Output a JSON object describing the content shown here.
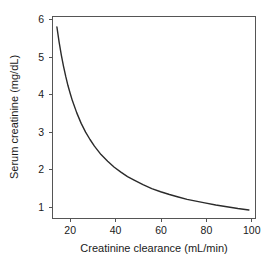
{
  "chart_data": {
    "type": "line",
    "title": "",
    "xlabel": "Creatinine clearance (mL/min)",
    "ylabel": "Serum creatinine (mg/dL)",
    "xlim": [
      11,
      103
    ],
    "ylim": [
      0.55,
      6.3
    ],
    "xticks": [
      20,
      40,
      60,
      80,
      100
    ],
    "xtick_labels": [
      "20",
      "40",
      "60",
      "80",
      "100"
    ],
    "yticks": [
      1,
      2,
      3,
      4,
      5,
      6
    ],
    "ytick_labels": [
      "1",
      "2",
      "3",
      "4",
      "5",
      "6"
    ],
    "grid": false,
    "legend": null,
    "legend_position": "none",
    "series": [
      {
        "name": "Serum creatinine vs creatinine clearance",
        "color": "#2b2b2b",
        "relationship": "serum creatinine = 78 / creatinine clearance",
        "x": [
          13,
          14,
          15,
          16,
          17,
          18,
          19,
          20,
          22,
          24,
          26,
          28,
          30,
          33,
          36,
          39,
          42,
          45,
          48,
          52,
          56,
          60,
          64,
          68,
          72,
          76,
          80,
          85,
          90,
          95,
          100
        ],
        "values": [
          6.0,
          5.57,
          5.2,
          4.88,
          4.59,
          4.33,
          4.11,
          3.9,
          3.55,
          3.25,
          3.0,
          2.79,
          2.6,
          2.36,
          2.17,
          2.0,
          1.86,
          1.73,
          1.63,
          1.5,
          1.39,
          1.3,
          1.22,
          1.15,
          1.08,
          1.03,
          0.98,
          0.92,
          0.87,
          0.82,
          0.78
        ]
      }
    ],
    "annotations": []
  },
  "figure": {
    "background_color": "#ffffff",
    "frame_color": "#555555",
    "curve_color": "#2b2b2b",
    "text_color": "#1a1a1a"
  },
  "axis": {
    "x_title": "Creatinine clearance (mL/min)",
    "y_title": "Serum creatinine (mg/dL)"
  }
}
